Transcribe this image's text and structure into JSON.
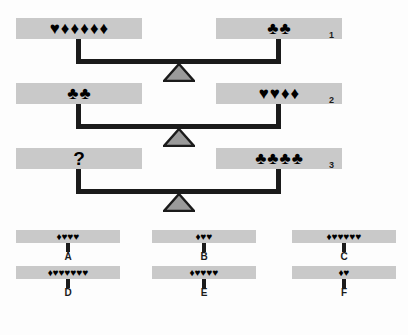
{
  "puzzle": {
    "type": "balance-scale-logic-puzzle",
    "symbol_glyphs": {
      "heart": "♥",
      "diamond": "♦",
      "club": "♣",
      "unknown": "?"
    },
    "colors": {
      "pan_fill": "#c9c9c9",
      "beam": "#1b1b1b",
      "fulcrum_fill": "#9a9a9a",
      "fulcrum_stroke": "#1b1b1b",
      "symbol": "#000000",
      "background": "#fdfdfd"
    },
    "scales": [
      {
        "number": "1",
        "left_pan": {
          "label": "1 heart and 5 diamonds",
          "symbols": [
            "heart",
            "diamond",
            "diamond",
            "diamond",
            "diamond",
            "diamond"
          ]
        },
        "right_pan": {
          "label": "2 clubs",
          "symbols": [
            "club",
            "club"
          ]
        }
      },
      {
        "number": "2",
        "left_pan": {
          "label": "2 clubs",
          "symbols": [
            "club",
            "club"
          ]
        },
        "right_pan": {
          "label": "2 hearts and 2 diamonds",
          "symbols": [
            "heart",
            "heart",
            "diamond",
            "diamond"
          ]
        }
      },
      {
        "number": "3",
        "left_pan": {
          "label": "unknown quantity",
          "symbols": [
            "unknown"
          ]
        },
        "right_pan": {
          "label": "4 clubs",
          "symbols": [
            "club",
            "club",
            "club",
            "club"
          ]
        }
      }
    ],
    "options": [
      {
        "letter": "A",
        "label": "1 diamond and 3 hearts",
        "symbols": [
          "diamond",
          "heart",
          "heart",
          "heart"
        ]
      },
      {
        "letter": "D",
        "label": "1 diamond and 6 hearts",
        "symbols": [
          "diamond",
          "heart",
          "heart",
          "heart",
          "heart",
          "heart",
          "heart"
        ]
      },
      {
        "letter": "B",
        "label": "1 diamond and 2 hearts",
        "symbols": [
          "diamond",
          "heart",
          "heart"
        ]
      },
      {
        "letter": "E",
        "label": "1 diamond and 4 hearts",
        "symbols": [
          "diamond",
          "heart",
          "heart",
          "heart",
          "heart"
        ]
      },
      {
        "letter": "C",
        "label": "1 diamond and 5 hearts",
        "symbols": [
          "diamond",
          "heart",
          "heart",
          "heart",
          "heart",
          "heart"
        ]
      },
      {
        "letter": "F",
        "label": "1 diamond and 1 heart",
        "symbols": [
          "diamond",
          "heart"
        ]
      }
    ]
  }
}
